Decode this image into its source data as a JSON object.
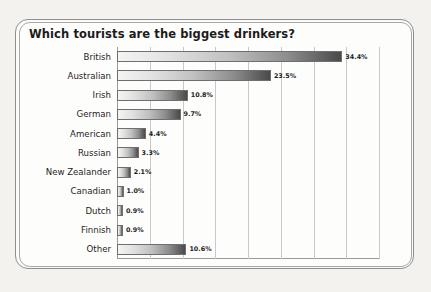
{
  "chart_data": {
    "type": "bar",
    "orientation": "horizontal",
    "title": "Which tourists are the biggest drinkers?",
    "xlabel": "",
    "ylabel": "",
    "xlim": [
      0,
      40
    ],
    "grid": true,
    "grid_interval": 5,
    "legend": "none",
    "value_suffix": "%",
    "categories": [
      "British",
      "Australian",
      "Irish",
      "German",
      "American",
      "Russian",
      "New Zealander",
      "Canadian",
      "Dutch",
      "Finnish",
      "Other"
    ],
    "values": [
      34.4,
      23.5,
      10.8,
      9.7,
      4.4,
      3.3,
      2.1,
      1.0,
      0.9,
      0.9,
      10.6
    ],
    "data_labels": [
      "34.4%",
      "23.5%",
      "10.8%",
      "9.7%",
      "4.4%",
      "3.3%",
      "2.1%",
      "1.0%",
      "0.9%",
      "0.9%",
      "10.6%"
    ],
    "points": [
      {
        "category": "British",
        "value": 34.4,
        "label": "34.4%"
      },
      {
        "category": "Australian",
        "value": 23.5,
        "label": "23.5%"
      },
      {
        "category": "Irish",
        "value": 10.8,
        "label": "10.8%"
      },
      {
        "category": "German",
        "value": 9.7,
        "label": "9.7%"
      },
      {
        "category": "American",
        "value": 4.4,
        "label": "4.4%"
      },
      {
        "category": "Russian",
        "value": 3.3,
        "label": "3.3%"
      },
      {
        "category": "New Zealander",
        "value": 2.1,
        "label": "2.1%"
      },
      {
        "category": "Canadian",
        "value": 1.0,
        "label": "1.0%"
      },
      {
        "category": "Dutch",
        "value": 0.9,
        "label": "0.9%"
      },
      {
        "category": "Finnish",
        "value": 0.9,
        "label": "0.9%"
      },
      {
        "category": "Other",
        "value": 10.6,
        "label": "10.6%"
      }
    ],
    "gridline_values": [
      0,
      5,
      10,
      15,
      20,
      25,
      30,
      35,
      40
    ],
    "colors": {
      "bar_gradient_start": "#f4f4f4",
      "bar_gradient_end": "#4a4a4a",
      "bar_border": "#6f6f6f",
      "grid": "#c9c9c9",
      "axis": "#9a9a9a",
      "text": "#1d1d1d",
      "page_background": "#f3f2ef",
      "panel_background": "#fdfdfc",
      "frame_border": "#8e8e8e"
    }
  }
}
